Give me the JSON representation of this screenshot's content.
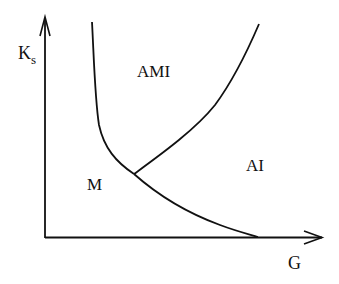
{
  "diagram": {
    "type": "phase-diagram",
    "axes": {
      "x": {
        "label": "G"
      },
      "y": {
        "label_main": "K",
        "label_subscript": "s"
      }
    },
    "regions": [
      {
        "id": "AMI",
        "label": "AMI"
      },
      {
        "id": "M",
        "label": "M"
      },
      {
        "id": "AI",
        "label": "AI"
      }
    ],
    "boundaries": [
      {
        "id": "M-AMI",
        "description": "left boundary descending steeply from top to triple point"
      },
      {
        "id": "AMI-AI",
        "description": "boundary rising from triple point to upper right"
      },
      {
        "id": "M-AI",
        "description": "boundary from triple point curving down to G axis"
      }
    ],
    "colors": {
      "line": "#111111",
      "background": "#ffffff"
    }
  }
}
